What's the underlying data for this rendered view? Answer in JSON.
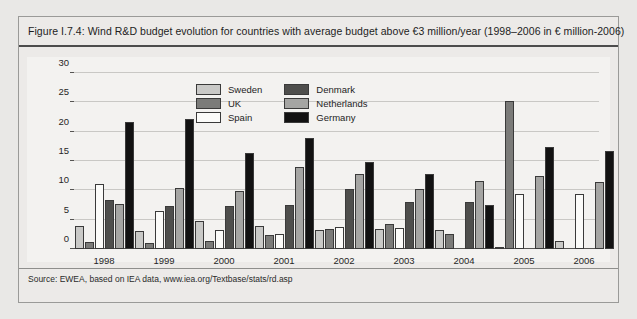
{
  "figure": {
    "title": "Figure I.7.4: Wind R&D budget evolution for countries with average budget above €3  million/year (1998–2006 in € million-2006)",
    "source": "Source: EWEA, based on IEA data, www.iea.org/Textbase/stats/rd.asp"
  },
  "colors": {
    "sweden": "#c9c9c7",
    "uk": "#7b7b79",
    "spain": "#fbfbf9",
    "denmark": "#4e4e4c",
    "netherlands": "#a5a5a3",
    "germany": "#121212",
    "panel": "#f3f2f0",
    "page": "#e9e8e6",
    "grid": "#c9c8c5",
    "axis": "#555452"
  },
  "chart_data": {
    "type": "bar",
    "title": "Figure I.7.4: Wind R&D budget evolution for countries with average budget above €3  million/year (1998–2006 in € million-2006)",
    "xlabel": "",
    "ylabel": "",
    "ylim": [
      0,
      30
    ],
    "yticks": [
      0,
      5,
      10,
      15,
      20,
      25,
      30
    ],
    "grid": true,
    "legend_position": "inside-top-center",
    "categories": [
      "1998",
      "1999",
      "2000",
      "2001",
      "2002",
      "2003",
      "2004",
      "2005",
      "2006"
    ],
    "series": [
      {
        "name": "Sweden",
        "values": [
          4.0,
          3.0,
          4.8,
          4.0,
          3.2,
          3.4,
          3.3,
          0.3,
          1.3
        ]
      },
      {
        "name": "UK",
        "values": [
          1.2,
          1.1,
          1.4,
          2.4,
          3.4,
          4.2,
          2.6,
          25.3,
          0.0
        ]
      },
      {
        "name": "Spain",
        "values": [
          11.0,
          6.4,
          3.3,
          2.5,
          3.7,
          3.6,
          0.0,
          9.3,
          9.3
        ]
      },
      {
        "name": "Denmark",
        "values": [
          8.3,
          7.4,
          7.3,
          7.5,
          10.2,
          8.0,
          8.0,
          0.0,
          0.0
        ]
      },
      {
        "name": "Netherlands",
        "values": [
          7.6,
          10.4,
          9.9,
          14.0,
          12.8,
          10.3,
          11.6,
          12.4,
          11.4
        ]
      },
      {
        "name": "Germany",
        "values": [
          21.7,
          22.2,
          16.3,
          19.0,
          14.8,
          12.8,
          7.5,
          17.4,
          16.7
        ]
      }
    ]
  },
  "legend": {
    "items": [
      {
        "label": "Sweden",
        "key": "sweden"
      },
      {
        "label": "Denmark",
        "key": "denmark"
      },
      {
        "label": "UK",
        "key": "uk"
      },
      {
        "label": "Netherlands",
        "key": "netherlands"
      },
      {
        "label": "Spain",
        "key": "spain"
      },
      {
        "label": "Germany",
        "key": "germany"
      }
    ]
  }
}
